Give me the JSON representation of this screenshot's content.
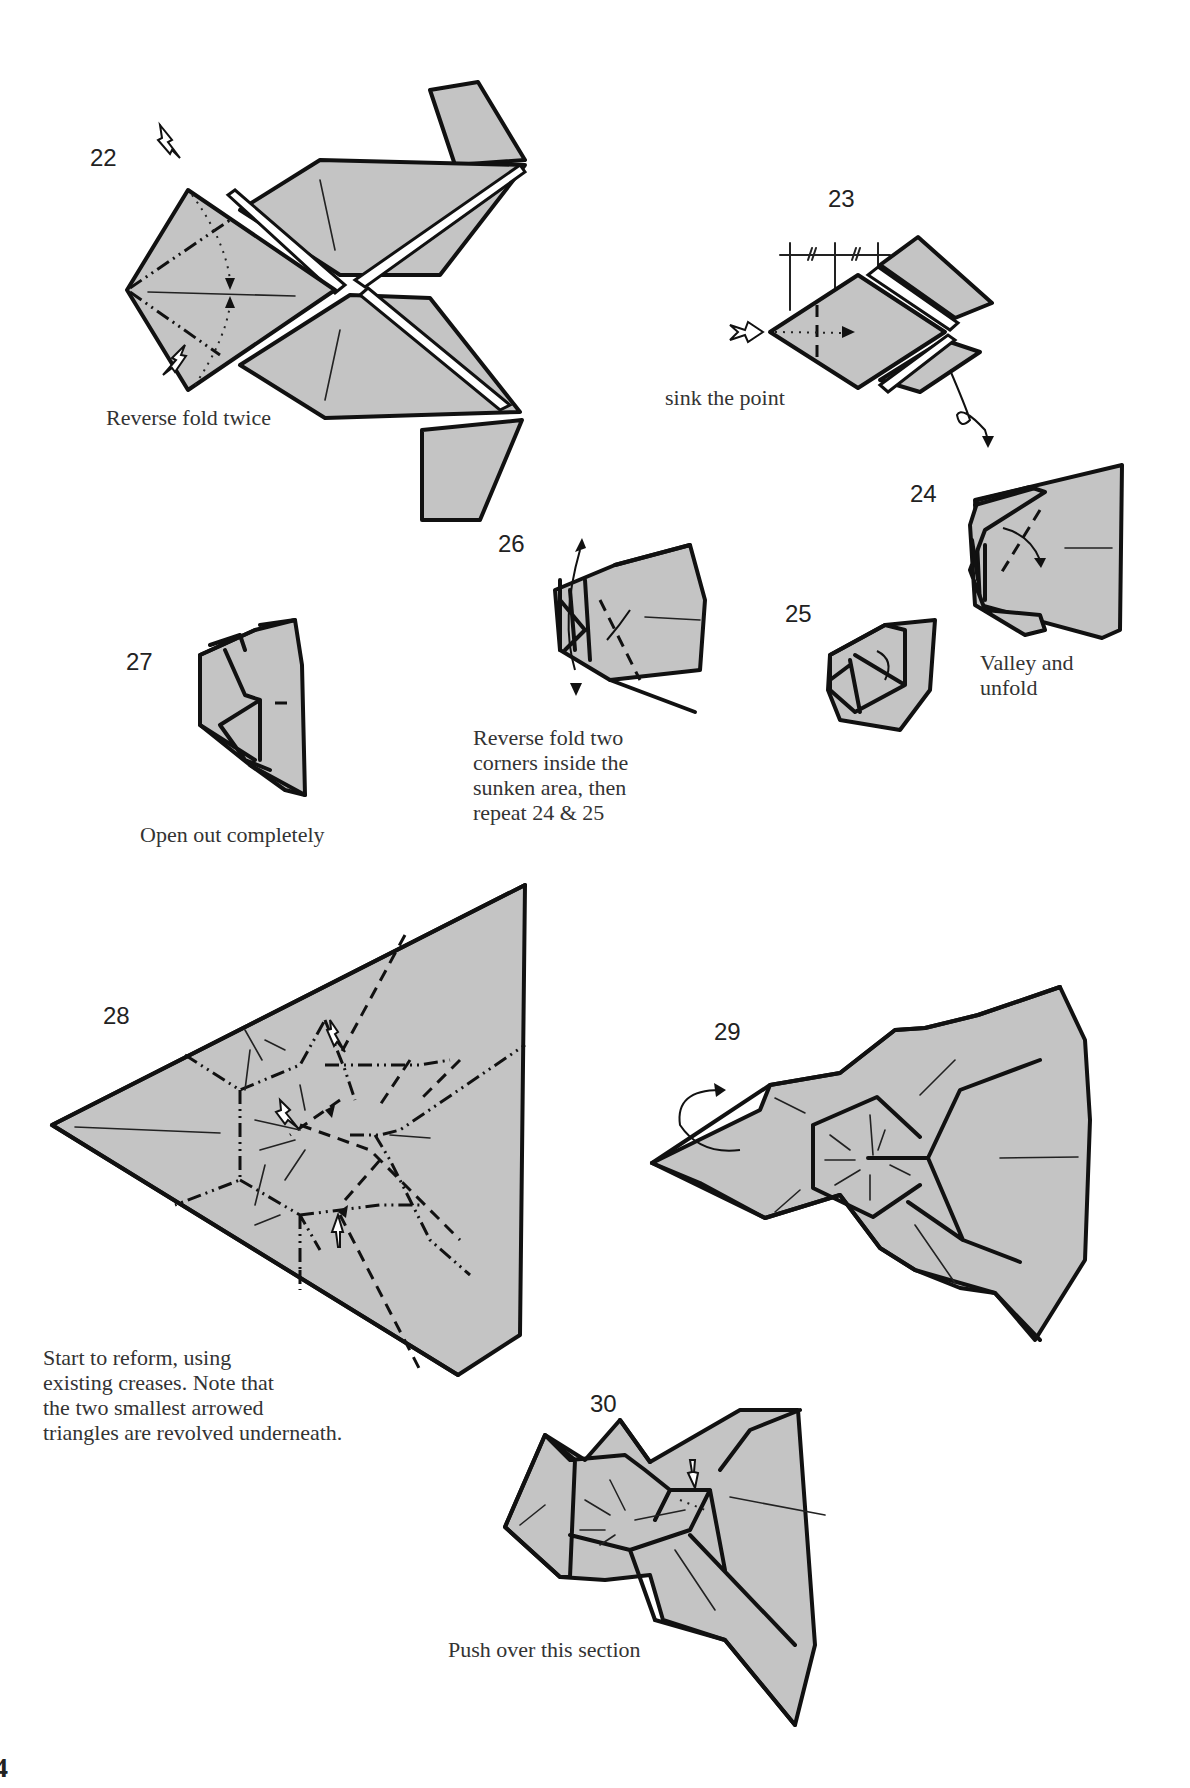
{
  "page": {
    "page_number": "4",
    "paper_color": "#c4c4c4",
    "line_color": "#111111"
  },
  "steps": [
    {
      "number": "22",
      "caption": [
        "Reverse fold twice"
      ]
    },
    {
      "number": "23",
      "caption": [
        "sink the point"
      ]
    },
    {
      "number": "24",
      "caption": [
        "Valley and",
        "unfold"
      ]
    },
    {
      "number": "25",
      "caption": []
    },
    {
      "number": "26",
      "caption": [
        "Reverse fold two",
        "corners inside the",
        "sunken area, then",
        "repeat 24 & 25"
      ]
    },
    {
      "number": "27",
      "caption": [
        "Open out completely"
      ]
    },
    {
      "number": "28",
      "caption": [
        "Start to reform, using",
        "existing creases. Note that",
        "the two smallest arrowed",
        "triangles are revolved underneath."
      ]
    },
    {
      "number": "29",
      "caption": []
    },
    {
      "number": "30",
      "caption": [
        "Push over this section"
      ]
    }
  ],
  "icons": {
    "push_arrow": "hollow-push-arrow-icon",
    "fold_arrow": "curved-fold-arrow-icon",
    "turn_over": "turn-over-loop-icon",
    "measure": "equal-division-marks-icon"
  }
}
